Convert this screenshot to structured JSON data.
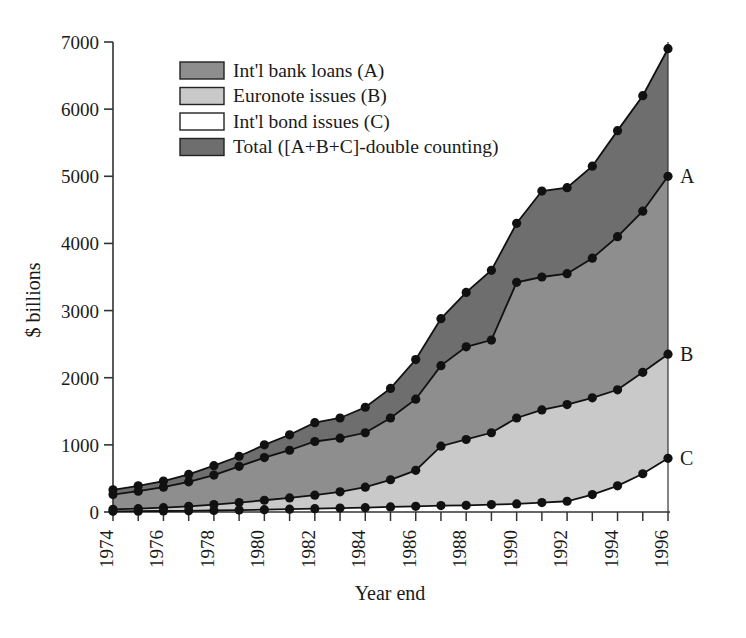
{
  "chart_data": {
    "type": "area",
    "title": "",
    "xlabel": "Year end",
    "ylabel": "$ billions",
    "ylim": [
      0,
      7000
    ],
    "xlim": [
      1974,
      1996
    ],
    "ytick_step": 1000,
    "yticks": [
      "0",
      "1000",
      "2000",
      "3000",
      "4000",
      "5000",
      "6000",
      "7000"
    ],
    "xticks_all": [
      1974,
      1975,
      1976,
      1977,
      1978,
      1979,
      1980,
      1981,
      1982,
      1983,
      1984,
      1985,
      1986,
      1987,
      1988,
      1989,
      1990,
      1991,
      1992,
      1993,
      1994,
      1995,
      1996
    ],
    "xtick_labels": [
      "1974",
      "1976",
      "1978",
      "1980",
      "1982",
      "1984",
      "1986",
      "1988",
      "1990",
      "1992",
      "1994",
      "1996"
    ],
    "grid": false,
    "legend_position": "top-left-inside",
    "x": [
      1974,
      1975,
      1976,
      1977,
      1978,
      1979,
      1980,
      1981,
      1982,
      1983,
      1984,
      1985,
      1986,
      1987,
      1988,
      1989,
      1990,
      1991,
      1992,
      1993,
      1994,
      1995,
      1996
    ],
    "series": [
      {
        "name": "Total ([A+B+C]-double counting)",
        "key": "total",
        "code": "",
        "color": "#6e6e6e",
        "values": [
          330,
          390,
          460,
          560,
          690,
          830,
          1000,
          1150,
          1330,
          1400,
          1560,
          1840,
          2270,
          2880,
          3270,
          3600,
          4300,
          4780,
          4830,
          5150,
          5680,
          6200,
          6900
        ]
      },
      {
        "name": "Int'l bank loans (A)",
        "key": "bank_loans",
        "code": "A",
        "color": "#8e8e8e",
        "values": [
          260,
          310,
          370,
          450,
          550,
          680,
          810,
          920,
          1050,
          1100,
          1180,
          1400,
          1680,
          2180,
          2460,
          2560,
          3420,
          3500,
          3550,
          3780,
          4100,
          4480,
          5000
        ]
      },
      {
        "name": "Euronote issues (B)",
        "key": "euronote",
        "code": "B",
        "color": "#c9c9c9",
        "values": [
          40,
          50,
          65,
          85,
          110,
          140,
          175,
          210,
          250,
          300,
          370,
          480,
          620,
          980,
          1080,
          1180,
          1400,
          1520,
          1600,
          1700,
          1820,
          2080,
          2350
        ]
      },
      {
        "name": "Int'l bond issues (C)",
        "key": "bond_issues",
        "code": "C",
        "color": "#ffffff",
        "values": [
          10,
          12,
          15,
          18,
          22,
          28,
          35,
          42,
          50,
          58,
          65,
          75,
          85,
          95,
          100,
          110,
          120,
          140,
          160,
          260,
          390,
          570,
          800
        ]
      }
    ],
    "legend": [
      {
        "label": "Int'l bank loans (A)",
        "swatch": "#8e8e8e"
      },
      {
        "label": "Euronote issues (B)",
        "swatch": "#c9c9c9"
      },
      {
        "label": "Int'l bond issues (C)",
        "swatch": "#ffffff"
      },
      {
        "label": "Total ([A+B+C]-double counting)",
        "swatch": "#6e6e6e"
      }
    ],
    "edge_labels": [
      "A",
      "B",
      "C"
    ],
    "marker": "filled-circle",
    "marker_color": "#111111",
    "line_color": "#111111"
  },
  "caption": {
    "text": ""
  }
}
